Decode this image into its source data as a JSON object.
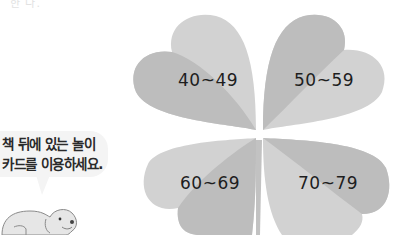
{
  "header": {
    "corner_text": "한 다."
  },
  "speech_bubble": {
    "line1": "책 뒤에 있는 놀이",
    "line2": "카드를 이용하세요."
  },
  "clover": {
    "colors": {
      "light": "#d2d2d2",
      "dark": "#bdbdbd",
      "text": "#1e1e1e"
    },
    "leaves": [
      {
        "position": "top-left",
        "label": "40~49"
      },
      {
        "position": "top-right",
        "label": "50~59"
      },
      {
        "position": "bottom-left",
        "label": "60~69"
      },
      {
        "position": "bottom-right",
        "label": "70~79"
      }
    ]
  },
  "illustration": {
    "character": "dog"
  }
}
